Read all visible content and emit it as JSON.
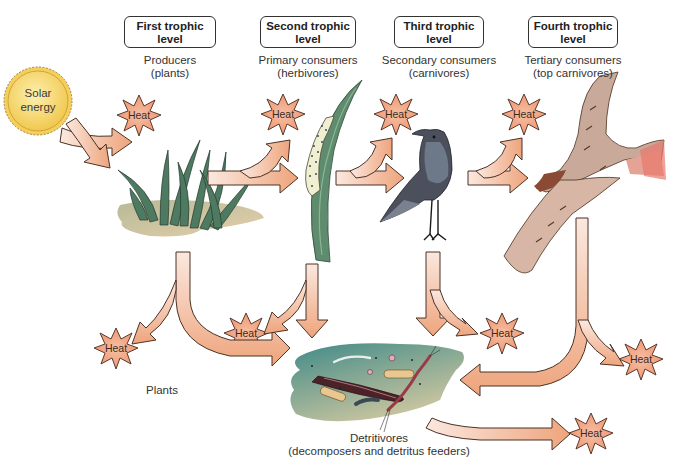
{
  "levels": [
    {
      "title_line1": "First trophic",
      "title_line2": "level",
      "sub_line1": "Producers",
      "sub_line2": "(plants)"
    },
    {
      "title_line1": "Second trophic",
      "title_line2": "level",
      "sub_line1": "Primary consumers",
      "sub_line2": "(herbivores)"
    },
    {
      "title_line1": "Third trophic",
      "title_line2": "level",
      "sub_line1": "Secondary consumers",
      "sub_line2": "(carnivores)"
    },
    {
      "title_line1": "Fourth trophic",
      "title_line2": "level",
      "sub_line1": "Tertiary consumers",
      "sub_line2": "(top carnivores)"
    }
  ],
  "sun": {
    "line1": "Solar",
    "line2": "energy"
  },
  "heat_label": "Heat",
  "plants_label": "Plants",
  "detritivores": {
    "line1": "Detritivores",
    "line2": "(decomposers and detritus feeders)"
  },
  "colors": {
    "arrow_light": "#fbe6dc",
    "arrow_dark": "#eea47c",
    "arrow_stroke": "#4a3226",
    "heat_fill": "#f29e7c",
    "sun_fill": "#f7d56a",
    "grass": "#4f7a62",
    "ground": "#cdbf9a",
    "crow": "#4a4f5c",
    "hawk": "#c9a89a",
    "detritus_bg": "#5e8f86"
  }
}
